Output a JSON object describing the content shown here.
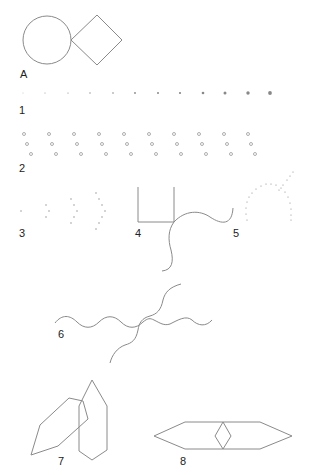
{
  "labels": {
    "A": "A",
    "f1": "1",
    "f2": "2",
    "f3": "3",
    "f4": "4",
    "f5": "5",
    "f6": "6",
    "f7": "7",
    "f8": "8"
  },
  "figures": [
    {
      "id": "A",
      "description": "circle touching a diamond (square rotated 45 degrees)"
    },
    {
      "id": "1",
      "description": "row of 12 dots increasing in size left to right"
    },
    {
      "id": "2",
      "description": "10 diagonal columns of 3 small circles each"
    },
    {
      "id": "3",
      "description": "dot groups forming progressively larger arcs (1, 3, 5, 7 dots)"
    },
    {
      "id": "4",
      "description": "U-shaped open rectangle with a wavy curve crossing at its corner"
    },
    {
      "id": "5",
      "description": "dotted arch intersected by a dotted diagonal line"
    },
    {
      "id": "6",
      "description": "horizontal wavy line crossed by a diagonal wavy line"
    },
    {
      "id": "7",
      "description": "two overlapping elongated hexagons, one tilted"
    },
    {
      "id": "8",
      "description": "horizontal elongated hexagon with a small diamond in its center"
    }
  ],
  "colors": {
    "stroke": "#8a8a8a",
    "text": "#222222",
    "background": "#ffffff"
  }
}
